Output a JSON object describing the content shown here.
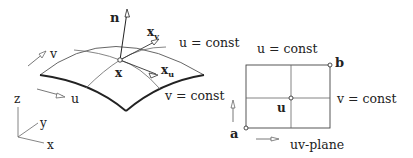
{
  "surface": {
    "normal_label": "n",
    "point_label": "x",
    "tangent_v_label": "x",
    "tangent_v_sub": "v",
    "tangent_u_label": "x",
    "tangent_u_sub": "u",
    "u_const_label": "u = const",
    "v_const_label": "v = const",
    "v_dir_label": "v",
    "u_dir_label": "u"
  },
  "axes": {
    "z_label": "z",
    "y_label": "y",
    "x_label": "x"
  },
  "uv_plane": {
    "u_const_label": "u = const",
    "v_const_label": "v = const",
    "corner_a_label": "a",
    "corner_b_label": "b",
    "point_label": "u",
    "plane_label": "uv-plane"
  }
}
